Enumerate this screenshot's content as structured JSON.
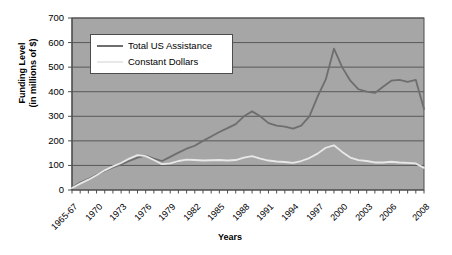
{
  "chart_data": {
    "type": "line",
    "title": "",
    "xlabel": "Years",
    "ylabel_line1": "Funding Level",
    "ylabel_line2": "(in millions of $)",
    "ylim": [
      0,
      700
    ],
    "ytick_values": [
      700,
      600,
      500,
      400,
      300,
      200,
      100,
      0
    ],
    "grid": true,
    "plot_background": "#a6a6a6",
    "legend_position": "top-left-inside",
    "x": [
      1965,
      1966,
      1967,
      1968,
      1969,
      1970,
      1971,
      1972,
      1973,
      1974,
      1975,
      1976,
      1977,
      1978,
      1979,
      1980,
      1981,
      1982,
      1983,
      1984,
      1985,
      1986,
      1987,
      1988,
      1989,
      1990,
      1991,
      1992,
      1993,
      1994,
      1995,
      1996,
      1997,
      1998,
      1999,
      2000,
      2001,
      2002,
      2003,
      2004,
      2005,
      2006,
      2007,
      2008
    ],
    "xtick_labels": [
      "1965-67",
      "1970",
      "1973",
      "1976",
      "1979",
      "1982",
      "1985",
      "1988",
      "1991",
      "1994",
      "1997",
      "2000",
      "2003",
      "2006",
      "2008"
    ],
    "series": [
      {
        "name": "Total US Assistance",
        "color": "#6e6e6e",
        "values": [
          10,
          30,
          45,
          62,
          78,
          92,
          104,
          118,
          132,
          140,
          128,
          118,
          135,
          152,
          168,
          180,
          200,
          218,
          236,
          252,
          268,
          300,
          320,
          300,
          272,
          262,
          258,
          250,
          262,
          300,
          380,
          450,
          575,
          500,
          445,
          410,
          400,
          395,
          420,
          445,
          448,
          440,
          448,
          330
        ]
      },
      {
        "name": "Constant Dollars",
        "color": "#e8e8e8",
        "values": [
          8,
          26,
          42,
          60,
          80,
          96,
          110,
          128,
          142,
          138,
          122,
          105,
          108,
          118,
          124,
          122,
          120,
          121,
          122,
          120,
          122,
          132,
          138,
          128,
          120,
          116,
          114,
          110,
          118,
          130,
          148,
          172,
          182,
          155,
          132,
          122,
          118,
          112,
          112,
          115,
          112,
          110,
          108,
          90
        ]
      }
    ]
  },
  "legend": {
    "entries": [
      {
        "label": "Total US Assistance"
      },
      {
        "label": "Constant Dollars"
      }
    ]
  }
}
